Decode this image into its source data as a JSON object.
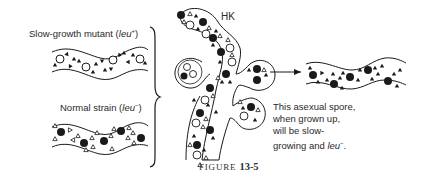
{
  "figure": {
    "caption_prefix": "FIGURE",
    "caption_number": "13-5"
  },
  "labels": {
    "slow_growth": {
      "text": "Slow-growth mutant (",
      "gene": "leu",
      "sup": "+",
      "close": ")"
    },
    "normal": {
      "text": "Normal strain (",
      "gene": "leu",
      "sup": "−",
      "close": ")"
    },
    "heterokaryon": "HK",
    "description": {
      "line1": "This asexual spore,",
      "line2": "when grown up,",
      "line3": "will be slow-",
      "line4_prefix": "growing and ",
      "line4_gene": "leu",
      "line4_sup": "−",
      "line4_end": "."
    }
  },
  "legend_symbols": {
    "open_circle": "slow-growth mutant nucleus",
    "filled_circle": "normal strain nucleus",
    "filled_triangle": "leu+ mitochondria",
    "open_triangle": "leu- mitochondria"
  },
  "colors": {
    "ink": "#1a1a1a",
    "background": "#ffffff"
  }
}
